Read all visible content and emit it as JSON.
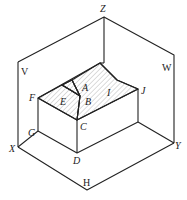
{
  "figure": {
    "type": "isometric-projection-diagram",
    "stroke_color": "#222222",
    "hatch_color": "#9a9a9a",
    "labels": {
      "Z": "Z",
      "V": "V",
      "W": "W",
      "H": "H",
      "X": "X",
      "Y": "Y",
      "A": "A",
      "B": "B",
      "C": "C",
      "D": "D",
      "E": "E",
      "F": "F",
      "G": "G",
      "I": "I",
      "J": "J"
    },
    "planes": [
      "V",
      "W",
      "H"
    ],
    "axes": [
      "X",
      "Y",
      "Z"
    ],
    "caption": ""
  }
}
